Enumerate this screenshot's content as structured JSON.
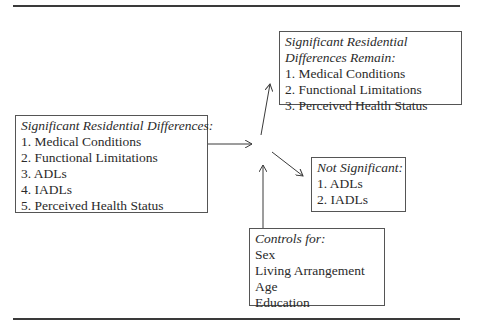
{
  "diagram": {
    "left_box": {
      "heading": "Significant Residential Differences:",
      "items": [
        "1. Medical Conditions",
        "2. Functional Limitations",
        "3. ADLs",
        "4. IADLs",
        "5. Perceived Health Status"
      ]
    },
    "top_right_box": {
      "heading_line1": "Significant Residential",
      "heading_line2": "Differences Remain:",
      "items": [
        "1. Medical Conditions",
        "2. Functional Limitations",
        "3. Perceived Health Status"
      ]
    },
    "not_significant_box": {
      "heading": "Not Significant:",
      "items": [
        "1. ADLs",
        "2. IADLs"
      ]
    },
    "controls_box": {
      "heading": "Controls for:",
      "items": [
        "Sex",
        "Living Arrangement",
        "Age",
        "Education"
      ]
    },
    "colors": {
      "line": "#3a3a3a",
      "border": "#555555",
      "text": "#2a2a2a"
    }
  }
}
